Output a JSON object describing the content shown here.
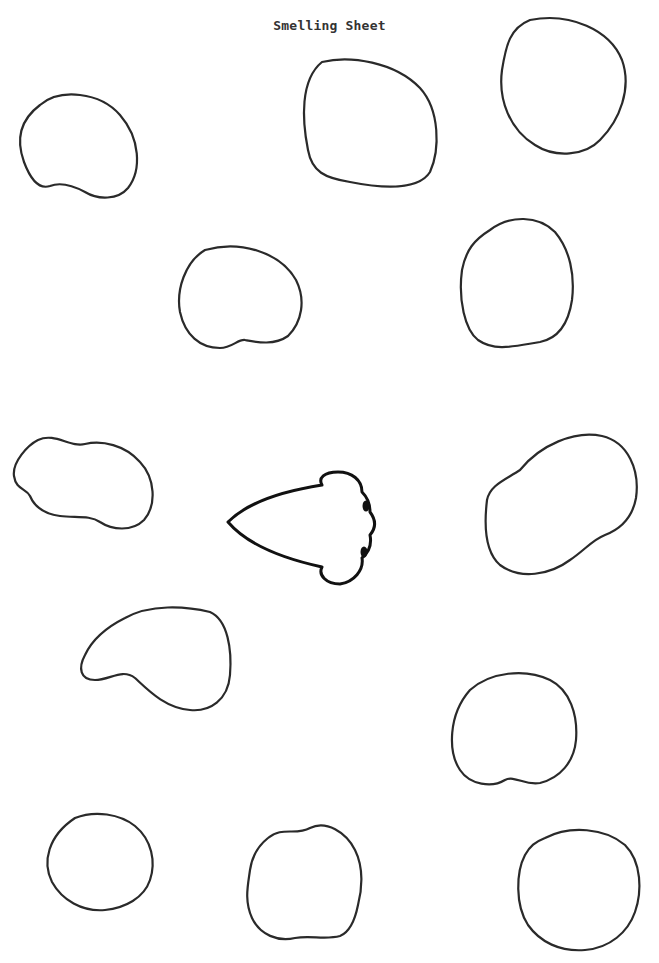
{
  "page": {
    "title": "Smelling Sheet"
  },
  "colors": {
    "stroke": "#2a2a2a",
    "background": "#ffffff"
  },
  "shapes": [
    {
      "id": "blob-1",
      "d": "M40,105 C60,88 100,92 120,115 C140,138 142,170 128,188 C118,200 98,200 85,192 C72,185 60,182 50,186 C38,190 30,178 24,162 C16,140 20,120 40,105 Z"
    },
    {
      "id": "blob-2",
      "d": "M322,62 C350,55 395,62 420,88 C440,110 440,150 430,172 C420,188 390,190 350,182 C325,178 312,172 308,150 C302,120 300,80 322,62 Z"
    },
    {
      "id": "blob-3",
      "d": "M530,20 C570,12 610,30 622,60 C632,88 620,120 600,140 C585,156 555,158 535,145 C510,130 498,100 502,70 C506,45 510,28 530,20 Z"
    },
    {
      "id": "blob-4",
      "d": "M205,250 C240,240 280,252 296,280 C306,300 302,322 288,336 C274,346 256,342 245,340 C238,339 232,348 220,348 C200,348 185,335 180,312 C176,290 185,262 205,250 Z"
    },
    {
      "id": "blob-5",
      "d": "M490,230 C510,215 538,215 555,232 C570,250 575,275 572,300 C569,320 560,338 540,342 C515,346 495,352 478,340 C465,330 458,300 462,270 C466,250 474,240 490,230 Z"
    },
    {
      "id": "blob-6",
      "d": "M38,440 C55,432 70,448 85,444 C102,440 125,445 140,462 C155,478 157,505 144,520 C132,532 112,530 100,522 C90,515 75,518 60,516 C45,514 35,508 30,496 C26,488 16,490 14,476 C12,462 28,445 38,440 Z"
    },
    {
      "id": "nose",
      "d": "M228,522 C250,500 290,490 322,485 C318,478 324,472 338,472 C352,472 362,480 362,492 C368,498 370,505 370,512 C376,520 376,528 370,535 C372,545 368,553 362,558 C364,570 354,582 340,584 C326,584 318,575 322,567 C290,560 250,548 228,522 Z",
      "stroke_class": "nose"
    },
    {
      "id": "blob-7",
      "d": "M520,470 C540,445 575,430 602,436 C628,442 640,470 636,498 C632,520 618,530 605,535 C592,540 585,550 570,560 C550,575 520,580 500,565 C485,552 484,525 487,500 C490,485 505,480 520,470 Z"
    },
    {
      "id": "blob-8",
      "d": "M125,618 C150,604 185,606 210,612 C228,620 232,650 230,675 C228,700 210,712 190,710 C165,708 148,690 135,678 C122,668 110,680 95,680 C80,680 78,668 85,655 C92,640 105,628 125,618 Z"
    },
    {
      "id": "blob-9",
      "d": "M470,690 C490,672 525,668 550,680 C570,690 578,715 576,740 C574,762 560,778 540,783 C525,786 515,775 505,780 C492,788 470,785 460,770 C448,752 448,715 470,690 Z"
    },
    {
      "id": "blob-10",
      "d": "M75,818 C95,810 120,814 135,826 C152,840 156,862 150,880 C144,898 125,908 105,910 C82,912 62,900 52,882 C42,862 48,836 75,818 Z"
    },
    {
      "id": "blob-11",
      "d": "M268,838 C282,826 296,836 310,828 C326,820 346,832 355,850 C364,868 362,890 358,905 C355,920 350,932 340,936 C325,940 310,935 295,938 C278,942 260,935 252,918 C244,900 248,885 250,870 C252,856 258,846 268,838 Z"
    },
    {
      "id": "blob-12",
      "d": "M545,838 C570,825 605,828 625,845 C642,862 642,892 635,912 C628,932 610,948 585,950 C560,952 540,942 528,925 C515,905 516,872 525,855 C530,846 535,842 545,838 Z"
    }
  ],
  "nostrils": [
    {
      "id": "nostril-top",
      "cx": 366,
      "cy": 506,
      "rx": 3.5,
      "ry": 5.5
    },
    {
      "id": "nostril-bottom",
      "cx": 364,
      "cy": 552,
      "rx": 3.5,
      "ry": 5.5
    }
  ]
}
